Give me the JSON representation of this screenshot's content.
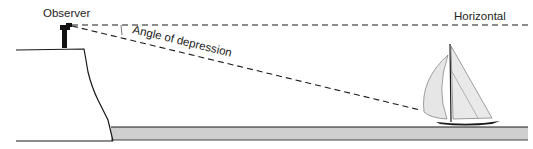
{
  "diagram": {
    "labels": {
      "observer": "Observer",
      "horizontal": "Horizontal",
      "angle": "Angle of depression"
    },
    "colors": {
      "line": "#1a1a1a",
      "water": "#cfcfcf",
      "sail": "#e6e6e6",
      "background": "#ffffff"
    }
  }
}
